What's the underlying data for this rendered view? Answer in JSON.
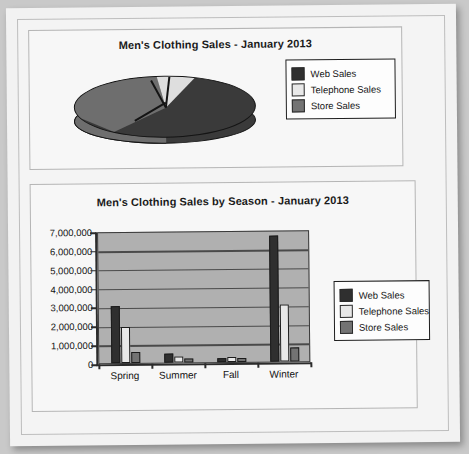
{
  "document": {
    "background_color": "#c9c9c9",
    "sheet_color": "#f2f2f2"
  },
  "pie_panel": {
    "title": "Men's Clothing Sales - January 2013",
    "legend": [
      {
        "label": "Web Sales",
        "color": "#2f2f2f"
      },
      {
        "label": "Telephone Sales",
        "color": "#e8e8e8"
      },
      {
        "label": "Store Sales",
        "color": "#737373"
      }
    ]
  },
  "bar_panel": {
    "title": "Men's Clothing Sales by Season - January 2013",
    "legend": [
      {
        "label": "Web Sales",
        "color": "#2f2f2f"
      },
      {
        "label": "Telephone Sales",
        "color": "#e8e8e8"
      },
      {
        "label": "Store Sales",
        "color": "#737373"
      }
    ],
    "y_tick_labels": [
      "7,000,000",
      "6,000,000",
      "5,000,000",
      "4,000,000",
      "3,000,000",
      "2,000,000",
      "1,000,000",
      "0"
    ],
    "x_tick_labels": [
      "Spring",
      "Summer",
      "Fall",
      "Winter"
    ]
  },
  "chart_data": [
    {
      "type": "pie",
      "title": "Men's Clothing Sales - January 2013",
      "labels": [
        "Web Sales",
        "Telephone Sales",
        "Store Sales"
      ],
      "values": [
        55,
        8,
        37
      ],
      "unit": "percent",
      "colors": [
        "#2f2f2f",
        "#e8e8e8",
        "#737373"
      ],
      "legend_position": "right",
      "three_d": true
    },
    {
      "type": "bar",
      "title": "Men's Clothing Sales by Season - January 2013",
      "categories": [
        "Spring",
        "Summer",
        "Fall",
        "Winter"
      ],
      "series": [
        {
          "name": "Web Sales",
          "color": "#2f2f2f",
          "values": [
            3000000,
            480000,
            200000,
            6700000
          ]
        },
        {
          "name": "Telephone Sales",
          "color": "#e8e8e8",
          "values": [
            1900000,
            330000,
            260000,
            3050000
          ]
        },
        {
          "name": "Store Sales",
          "color": "#737373",
          "values": [
            600000,
            200000,
            220000,
            750000
          ]
        }
      ],
      "xlabel": "",
      "ylabel": "",
      "ylim": [
        0,
        7000000
      ],
      "ytick_step": 1000000,
      "grid": true,
      "legend_position": "right",
      "plot_background": "#b0b0b0"
    }
  ]
}
